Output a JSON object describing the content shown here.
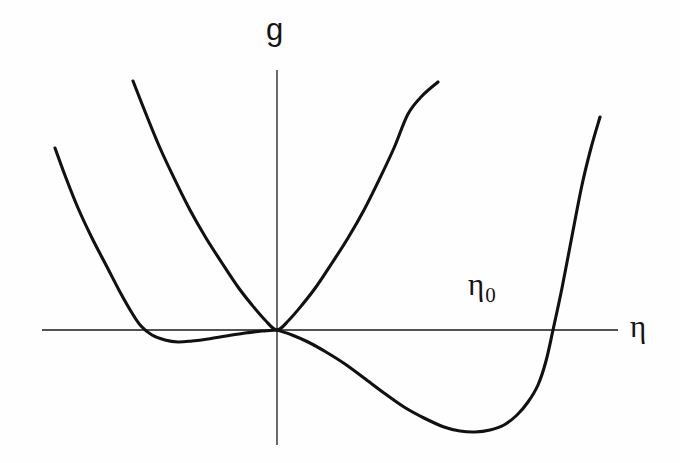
{
  "figure": {
    "name": "landau-free-energy-plot",
    "background_color": "#fefefe",
    "curve_color": "#111111",
    "axis_color": "#1a1a1a",
    "width": 680,
    "height": 463
  },
  "labels": {
    "y_axis": "g",
    "x_axis": "η",
    "annotation_eta0": "η",
    "annotation_eta0_sub": "0"
  },
  "chart_data": {
    "type": "line",
    "title": "",
    "xlabel": "η",
    "ylabel": "g",
    "grid": false,
    "legend": false,
    "axes": {
      "origin_px": [
        277,
        330
      ],
      "x_axis_px": {
        "x1": 42,
        "x2": 618,
        "y": 330
      },
      "y_axis_px": {
        "x": 277,
        "y1": 70,
        "y2": 445
      },
      "xlim": [
        -1.63,
        1.58
      ],
      "ylim": [
        -0.62,
        0.72
      ]
    },
    "annotations": [
      {
        "text": "η₀",
        "meaning": "root of deep-well curve on positive axis",
        "px": [
          484,
          288
        ],
        "data_x": 0.78,
        "data_y": 0.115
      }
    ],
    "series": [
      {
        "name": "narrow-symmetric-parabola",
        "description": "steep symmetric parabola with minimum at the origin; g = a*eta^2 with large a",
        "min_px": [
          277,
          330
        ],
        "min_data": [
          0.0,
          0.0
        ],
        "points_px": [
          [
            133,
            81
          ],
          [
            146,
            114
          ],
          [
            160,
            148
          ],
          [
            175,
            180
          ],
          [
            190,
            210
          ],
          [
            206,
            238
          ],
          [
            222,
            263
          ],
          [
            238,
            287
          ],
          [
            252,
            305
          ],
          [
            265,
            320
          ],
          [
            277,
            330
          ],
          [
            289,
            320
          ],
          [
            302,
            305
          ],
          [
            316,
            287
          ],
          [
            332,
            263
          ],
          [
            348,
            238
          ],
          [
            364,
            210
          ],
          [
            379,
            180
          ],
          [
            394,
            148
          ],
          [
            408,
            114
          ],
          [
            422,
            96
          ],
          [
            438,
            82
          ]
        ]
      },
      {
        "name": "shallow-left-well-curve",
        "description": "broad flat curve with a shallow minimum left of the origin, rises steeply far left, returns to zero at the origin and stays near zero to the right",
        "min_px": [
          178,
          342
        ],
        "min_data": [
          -0.55,
          -0.065
        ],
        "root_px": [
          137,
          330
        ],
        "points_px": [
          [
            55,
            148
          ],
          [
            66,
            178
          ],
          [
            78,
            208
          ],
          [
            92,
            238
          ],
          [
            106,
            265
          ],
          [
            120,
            292
          ],
          [
            132,
            313
          ],
          [
            141,
            326
          ],
          [
            152,
            335
          ],
          [
            165,
            340
          ],
          [
            178,
            342
          ],
          [
            192,
            341
          ],
          [
            208,
            339
          ],
          [
            226,
            336
          ],
          [
            245,
            333
          ],
          [
            262,
            331
          ],
          [
            277,
            330
          ]
        ]
      },
      {
        "name": "deep-right-well-curve",
        "description": "asymmetric double-well branch: leaves the origin going down, deep minimum to the right, crosses zero at eta_0 then rises steeply",
        "min_px": [
          475,
          432
        ],
        "min_data": [
          1.07,
          -0.53
        ],
        "root_px": [
          553,
          330
        ],
        "points_px": [
          [
            277,
            330
          ],
          [
            292,
            335
          ],
          [
            308,
            342
          ],
          [
            326,
            352
          ],
          [
            345,
            364
          ],
          [
            364,
            378
          ],
          [
            384,
            393
          ],
          [
            404,
            407
          ],
          [
            424,
            418
          ],
          [
            444,
            427
          ],
          [
            460,
            431
          ],
          [
            475,
            432
          ],
          [
            490,
            430
          ],
          [
            504,
            425
          ],
          [
            517,
            415
          ],
          [
            528,
            402
          ],
          [
            538,
            385
          ],
          [
            546,
            361
          ],
          [
            553,
            330
          ],
          [
            562,
            288
          ],
          [
            572,
            236
          ],
          [
            582,
            185
          ],
          [
            591,
            148
          ],
          [
            600,
            117
          ]
        ]
      }
    ]
  }
}
